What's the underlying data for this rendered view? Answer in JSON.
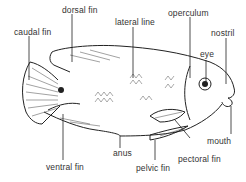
{
  "diagram": {
    "colors": {
      "ink": "#222222",
      "label": "#333333",
      "background": "#ffffff"
    },
    "labels": [
      {
        "id": "dorsal-fin",
        "text": "dorsal fin"
      },
      {
        "id": "caudal-fin",
        "text": "caudal fin"
      },
      {
        "id": "lateral-line",
        "text": "lateral line"
      },
      {
        "id": "operculum",
        "text": "operculum"
      },
      {
        "id": "nostril",
        "text": "nostril"
      },
      {
        "id": "eye",
        "text": "eye"
      },
      {
        "id": "mouth",
        "text": "mouth"
      },
      {
        "id": "pectoral-fin",
        "text": "pectoral fin"
      },
      {
        "id": "pelvic-fin",
        "text": "pelvic fin"
      },
      {
        "id": "anus",
        "text": "anus"
      },
      {
        "id": "ventral-fin",
        "text": "ventral fin"
      }
    ]
  }
}
